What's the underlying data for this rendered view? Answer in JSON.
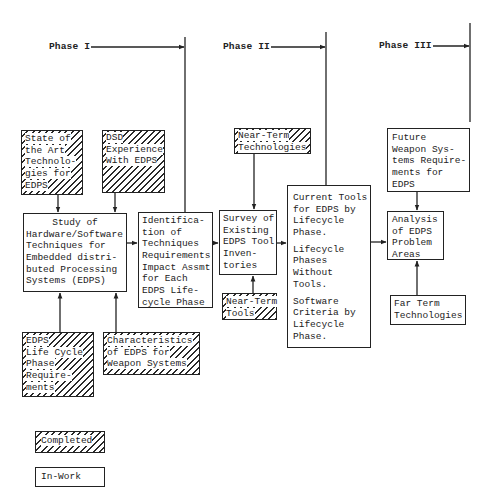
{
  "phases": [
    {
      "label": "Phase I"
    },
    {
      "label": "Phase II"
    },
    {
      "label": "Phase III"
    }
  ],
  "boxes": {
    "state_of_art": {
      "status": "completed",
      "lines": [
        "State of",
        "the Art",
        "Technolo-",
        "gies for",
        "EDPS"
      ]
    },
    "dsd_experience": {
      "status": "completed",
      "lines": [
        "DSD",
        "Experience",
        "With EDPS"
      ]
    },
    "study": {
      "status": "in-work",
      "lines": [
        "Study of",
        "Hardware/Software",
        "Techniques for",
        "Embedded distri-",
        "buted Processing",
        "Systems (EDPS)"
      ]
    },
    "identification": {
      "status": "in-work",
      "lines": [
        "Identifica-",
        "tion of",
        "Techniques",
        "Requirements",
        "Impact Assmt",
        "for Each",
        "EDPS Life-",
        "cycle Phase"
      ]
    },
    "near_term_technologies": {
      "status": "completed",
      "lines": [
        "Near-Term",
        "Technologies"
      ]
    },
    "survey": {
      "status": "in-work",
      "lines": [
        "Survey of",
        "Existing",
        "EDPS Tool",
        "Inven-",
        "tories"
      ]
    },
    "near_term_tools": {
      "status": "completed",
      "lines": [
        "Near-Term",
        "Tools"
      ]
    },
    "current_tools": {
      "status": "in-work",
      "paragraphs": [
        [
          "Current Tools",
          "for EDPS by",
          "Lifecycle",
          "Phase."
        ],
        [
          "Lifecycle",
          "Phases",
          "Without",
          "Tools."
        ],
        [
          "Software",
          "Criteria by",
          "Lifecycle",
          "Phase."
        ]
      ]
    },
    "future_weapon": {
      "status": "in-work",
      "lines": [
        "Future",
        "Weapon Sys-",
        "tems Require-",
        "ments for",
        "EDPS"
      ]
    },
    "analysis": {
      "status": "in-work",
      "lines": [
        "Analysis",
        "of EDPS",
        "Problem",
        "Areas"
      ]
    },
    "far_term": {
      "status": "in-work",
      "lines": [
        "Far Term",
        "Technologies"
      ]
    },
    "edps_life_cycle": {
      "status": "completed",
      "lines": [
        "EDPS",
        "Life Cycle",
        "Phase",
        "Require-",
        "ments"
      ]
    },
    "characteristics": {
      "status": "completed",
      "lines": [
        "Characteristics",
        "of EDPS for",
        "Weapon Systems"
      ]
    }
  },
  "legend": {
    "completed": "Completed",
    "in_work": "In-Work"
  },
  "colors": {
    "ink": "#222222",
    "paper": "#ffffff"
  }
}
